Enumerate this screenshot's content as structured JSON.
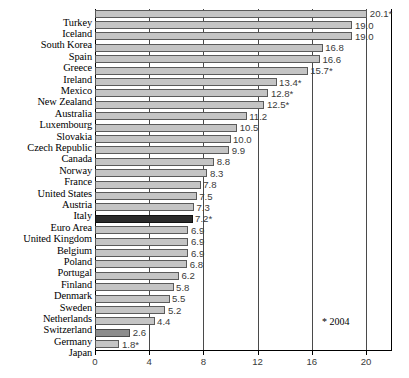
{
  "chart_data": {
    "type": "bar",
    "orientation": "horizontal",
    "title": "",
    "subtitle": "",
    "xlabel": "",
    "ylabel": "",
    "xlim": [
      0,
      21.9
    ],
    "xticks": [
      0,
      4,
      8,
      12,
      16,
      20
    ],
    "xtick_labels": [
      "0",
      "4",
      "8",
      "12",
      "16",
      "20"
    ],
    "grid": true,
    "grid_axis": "x",
    "legend": null,
    "categories": [
      "Turkey",
      "Iceland",
      "South Korea",
      "Spain",
      "Greece",
      "Ireland",
      "Mexico",
      "New Zealand",
      "Australia",
      "Luxembourg",
      "Slovakia",
      "Czech Republic",
      "Canada",
      "Norway",
      "France",
      "United States",
      "Austria",
      "Italy",
      "Euro Area",
      "United Kingdom",
      "Belgium",
      "Poland",
      "Portugal",
      "Finland",
      "Denmark",
      "Sweden",
      "Netherlands",
      "Switzerland",
      "Germany",
      "Japan"
    ],
    "values": [
      20.1,
      19.0,
      19.0,
      16.8,
      16.6,
      15.7,
      13.4,
      12.8,
      12.5,
      11.2,
      10.5,
      10.0,
      9.9,
      8.8,
      8.3,
      7.8,
      7.5,
      7.3,
      7.2,
      6.9,
      6.9,
      6.9,
      6.8,
      6.2,
      5.8,
      5.5,
      5.2,
      4.4,
      2.6,
      1.8
    ],
    "data_labels": [
      "20.1*",
      "19.0",
      "19.0",
      "16.8",
      "16.6",
      "15.7*",
      "13.4*",
      "12.8*",
      "12.5*",
      "11.2",
      "10.5",
      "10.0",
      "9.9",
      "8.8",
      "8.3",
      "7.8",
      "7.5",
      "7.3",
      "7.2*",
      "6.9",
      "6.9",
      "6.9",
      "6.8",
      "6.2",
      "5.8",
      "5.5",
      "5.2",
      "4.4",
      "2.6",
      "1.8*"
    ],
    "highlight": {
      "Euro Area": "dark",
      "Germany": "mid"
    },
    "annotations": [
      "* 2004"
    ],
    "footnote": "* 2004",
    "colors": {
      "bar_default": "#c4c4c4",
      "bar_highlight_dark": "#2a2a2a",
      "bar_highlight_mid": "#8c8c8c",
      "bar_border": "#5a5a5a",
      "gridline": "#4a4a4a",
      "axis": "#000000",
      "label_text": "#000000",
      "value_text": "#3a3a3a"
    }
  }
}
